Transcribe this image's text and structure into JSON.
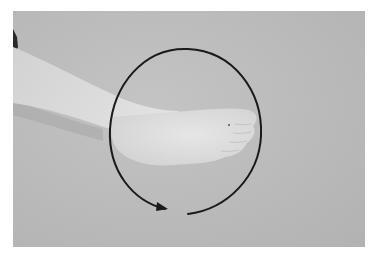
{
  "image": {
    "description": "Photograph of a lower leg and bare foot extended horizontally against a gray backdrop, with a circular arrow drawn around the foot indicating ankle rotation (circles).",
    "subject": "foot and ankle",
    "annotation": {
      "type": "circular-arrow",
      "direction": "counterclockwise",
      "color": "#1a1a1a"
    },
    "colors": {
      "backdrop": "#bababa",
      "skin": "#dcdcdc",
      "page_background": "#ffffff"
    }
  }
}
